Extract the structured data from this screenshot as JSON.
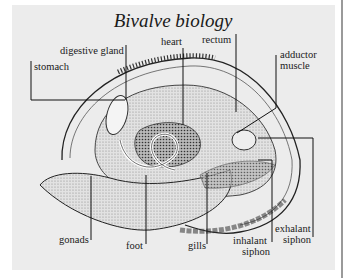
{
  "title": "Bivalve biology",
  "labels": {
    "stomach": "stomach",
    "digestive_gland": "digestive gland",
    "heart": "heart",
    "rectum": "rectum",
    "adductor_muscle_1": "adductor",
    "adductor_muscle_2": "muscle",
    "gonads": "gonads",
    "foot": "foot",
    "gills": "gills",
    "inhalant_siphon_1": "inhalant",
    "inhalant_siphon_2": "siphon",
    "exhalant_siphon_1": "exhalant",
    "exhalant_siphon_2": "siphon"
  },
  "colors": {
    "panel": "#ececec",
    "ink": "#1a1a1a",
    "shading": "#9c9c9c"
  }
}
